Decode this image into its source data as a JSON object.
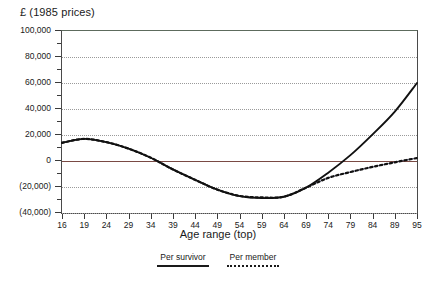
{
  "chart_data": {
    "type": "line",
    "title": "",
    "ylabel": "£ (1985 prices)",
    "xlabel": "Age range (top)",
    "ylim": [
      -40000,
      100000
    ],
    "xlim": [
      16,
      95
    ],
    "grid": true,
    "legend_position": "bottom-center",
    "ytick_labels": [
      "100,000",
      "80,000",
      "60,000",
      "40,000",
      "20,000",
      "0",
      "(20,000)",
      "(40,000)"
    ],
    "ytick_values": [
      100000,
      80000,
      60000,
      40000,
      20000,
      0,
      -20000,
      -40000
    ],
    "xtick_labels": [
      "16",
      "19",
      "24",
      "29",
      "34",
      "39",
      "44",
      "49",
      "54",
      "59",
      "64",
      "69",
      "74",
      "79",
      "84",
      "89",
      "95"
    ],
    "xtick_values": [
      16,
      19,
      24,
      29,
      34,
      39,
      44,
      49,
      54,
      59,
      64,
      69,
      74,
      79,
      84,
      89,
      95
    ],
    "x": [
      16,
      19,
      24,
      29,
      34,
      39,
      44,
      49,
      54,
      59,
      64,
      69,
      74,
      79,
      84,
      89,
      95
    ],
    "series": [
      {
        "name": "Per survivor",
        "style": "solid",
        "color": "#111111",
        "values": [
          14000,
          17000,
          14500,
          9500,
          2500,
          -6500,
          -14500,
          -22000,
          -27000,
          -28500,
          -27500,
          -20500,
          -9000,
          4500,
          20500,
          38000,
          60000
        ]
      },
      {
        "name": "Per member",
        "style": "dotted",
        "color": "#111111",
        "values": [
          14000,
          17000,
          14500,
          9500,
          2500,
          -6500,
          -14500,
          -22000,
          -26800,
          -28000,
          -27500,
          -20500,
          -13000,
          -8500,
          -4500,
          -1000,
          2300
        ]
      }
    ]
  },
  "legend": {
    "items": [
      {
        "label": "Per survivor",
        "style": "solid"
      },
      {
        "label": "Per member",
        "style": "dotted"
      }
    ]
  },
  "colors": {
    "zero_line": "#7a4a44",
    "frame": "#4a4a4a",
    "frame_top": "#5d6b5d",
    "grid": "#9a9a9a",
    "series_line": "#111111",
    "plateau_tint": "#4a4ab0"
  }
}
